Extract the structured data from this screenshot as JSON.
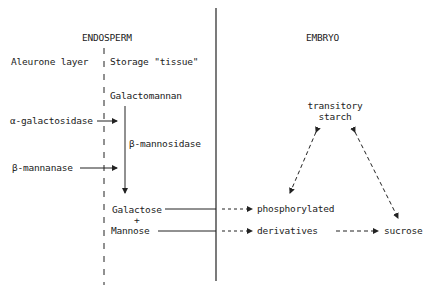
{
  "headers": {
    "endosperm": "ENDOSPERM",
    "embryo": "EMBRYO"
  },
  "regions": {
    "aleurone": "Aleurone layer",
    "storage": "Storage \"tissue\""
  },
  "nodes": {
    "galactomannan": "Galactomannan",
    "alpha_gal": "α-galactosidase",
    "beta_mannosidase": "β-mannosidase",
    "beta_mannanase": "β-mannanase",
    "galactose": "Galactose",
    "plus": "+",
    "mannose": "Mannose",
    "transitory_1": "transitory",
    "transitory_2": "starch",
    "phosphorylated": "phosphorylated",
    "derivatives": "derivatives",
    "sucrose": "sucrose"
  }
}
